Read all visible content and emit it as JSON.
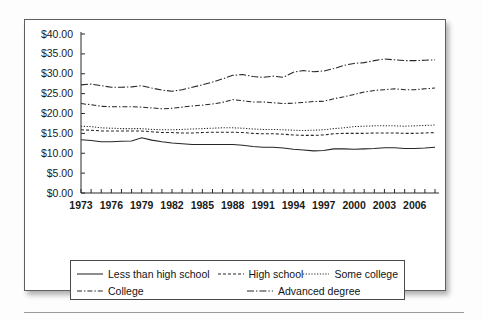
{
  "figure": {
    "background_color": "#ffffff",
    "border_color": "#5f5f5f",
    "line_color": "#262626"
  },
  "legend": {
    "rows": [
      [
        {
          "label": "Less than high school",
          "style": "solid"
        },
        {
          "label": "High school",
          "style": "dashed"
        },
        {
          "label": "Some college",
          "style": "dotted"
        }
      ],
      [
        {
          "label": "College",
          "style": "dash-dot"
        },
        {
          "label": "Advanced degree",
          "style": "long-dash-dot"
        }
      ]
    ]
  },
  "chart_data": {
    "type": "line",
    "title": "",
    "xlabel": "",
    "ylabel": "",
    "xlim": [
      1973,
      2008
    ],
    "ylim": [
      0,
      40
    ],
    "ytick_labels": [
      "$40.00",
      "$35.00",
      "$30.00",
      "$25.00",
      "$20.00",
      "$15.00",
      "$10.00",
      "$5.00",
      "$0.00"
    ],
    "ytick_values": [
      40,
      35,
      30,
      25,
      20,
      15,
      10,
      5,
      0
    ],
    "xtick_labels": [
      "1973",
      "1976",
      "1979",
      "1982",
      "1985",
      "1988",
      "1991",
      "1994",
      "1997",
      "2000",
      "2003",
      "2006"
    ],
    "xtick_values": [
      1973,
      1976,
      1979,
      1982,
      1985,
      1988,
      1991,
      1994,
      1997,
      2000,
      2003,
      2006
    ],
    "minor_xticks_every": 1,
    "grid": false,
    "legend_position": "below",
    "x": [
      1973,
      1974,
      1975,
      1976,
      1977,
      1978,
      1979,
      1980,
      1981,
      1982,
      1983,
      1984,
      1985,
      1986,
      1987,
      1988,
      1989,
      1990,
      1991,
      1992,
      1993,
      1994,
      1995,
      1996,
      1997,
      1998,
      1999,
      2000,
      2001,
      2002,
      2003,
      2004,
      2005,
      2006,
      2007,
      2008
    ],
    "series": [
      {
        "name": "Less than high school",
        "style": "solid",
        "values": [
          13.4,
          13.2,
          12.9,
          12.9,
          13.0,
          13.1,
          13.9,
          13.3,
          12.9,
          12.6,
          12.4,
          12.2,
          12.2,
          12.2,
          12.2,
          12.2,
          12.0,
          11.7,
          11.5,
          11.5,
          11.3,
          11.0,
          10.8,
          10.6,
          10.7,
          11.1,
          11.1,
          11.0,
          11.1,
          11.2,
          11.4,
          11.4,
          11.2,
          11.2,
          11.3,
          11.5
        ]
      },
      {
        "name": "High school",
        "style": "dashed",
        "values": [
          15.9,
          15.8,
          15.6,
          15.6,
          15.6,
          15.6,
          15.6,
          15.4,
          15.2,
          15.2,
          15.1,
          15.1,
          15.2,
          15.3,
          15.3,
          15.3,
          15.2,
          15.0,
          14.9,
          14.9,
          14.8,
          14.6,
          14.5,
          14.5,
          14.6,
          14.9,
          15.0,
          15.0,
          15.0,
          15.1,
          15.1,
          15.1,
          15.0,
          15.0,
          15.1,
          15.2
        ]
      },
      {
        "name": "Some college",
        "style": "dotted",
        "values": [
          16.8,
          16.7,
          16.4,
          16.3,
          16.2,
          16.2,
          16.2,
          16.0,
          15.9,
          15.9,
          16.0,
          16.1,
          16.2,
          16.3,
          16.4,
          16.4,
          16.3,
          16.1,
          16.0,
          16.0,
          15.9,
          15.8,
          15.7,
          15.8,
          15.9,
          16.2,
          16.4,
          16.7,
          16.8,
          16.9,
          16.9,
          16.9,
          16.8,
          16.9,
          17.0,
          17.1
        ]
      },
      {
        "name": "College",
        "style": "dash-dot",
        "values": [
          22.5,
          22.2,
          21.8,
          21.7,
          21.7,
          21.7,
          21.6,
          21.4,
          21.2,
          21.3,
          21.6,
          21.9,
          22.1,
          22.4,
          22.8,
          23.5,
          23.2,
          22.9,
          22.9,
          22.7,
          22.5,
          22.6,
          22.8,
          23.0,
          23.1,
          23.7,
          24.2,
          24.8,
          25.4,
          25.8,
          26.0,
          26.2,
          26.0,
          26.0,
          26.2,
          26.4
        ]
      },
      {
        "name": "Advanced degree",
        "style": "long-dash-dot",
        "values": [
          27.2,
          27.4,
          27.0,
          26.6,
          26.6,
          26.7,
          27.0,
          26.4,
          25.9,
          25.6,
          26.0,
          26.6,
          27.2,
          27.9,
          28.7,
          29.6,
          29.8,
          29.3,
          29.1,
          29.4,
          29.1,
          30.4,
          30.8,
          30.5,
          30.7,
          31.3,
          32.1,
          32.6,
          32.8,
          33.3,
          33.7,
          33.5,
          33.3,
          33.3,
          33.4,
          33.5
        ]
      }
    ]
  }
}
